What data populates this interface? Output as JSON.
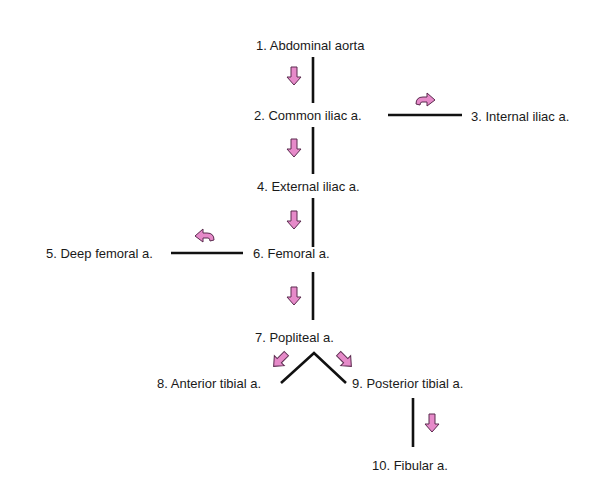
{
  "diagram": {
    "nodes": [
      {
        "id": 1,
        "label": "1. Abdominal aorta"
      },
      {
        "id": 2,
        "label": "2. Common iliac a."
      },
      {
        "id": 3,
        "label": "3. Internal iliac a."
      },
      {
        "id": 4,
        "label": "4. External iliac a."
      },
      {
        "id": 5,
        "label": "5. Deep femoral a."
      },
      {
        "id": 6,
        "label": "6. Femoral a."
      },
      {
        "id": 7,
        "label": "7. Popliteal a."
      },
      {
        "id": 8,
        "label": "8. Anterior tibial a."
      },
      {
        "id": 9,
        "label": "9. Posterior tibial a."
      },
      {
        "id": 10,
        "label": "10. Fibular a."
      }
    ],
    "edges": [
      {
        "from": 1,
        "to": 2,
        "direction": "down"
      },
      {
        "from": 2,
        "to": 3,
        "direction": "right"
      },
      {
        "from": 2,
        "to": 4,
        "direction": "down"
      },
      {
        "from": 4,
        "to": 6,
        "direction": "down"
      },
      {
        "from": 6,
        "to": 5,
        "direction": "left"
      },
      {
        "from": 6,
        "to": 7,
        "direction": "down"
      },
      {
        "from": 7,
        "to": 8,
        "direction": "down-left"
      },
      {
        "from": 7,
        "to": 9,
        "direction": "down-right"
      },
      {
        "from": 9,
        "to": 10,
        "direction": "down"
      }
    ],
    "colors": {
      "arrow_fill": "#e68ac9",
      "line": "#111111"
    }
  }
}
